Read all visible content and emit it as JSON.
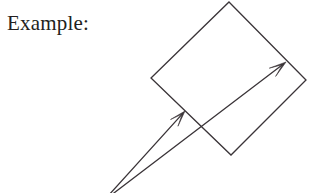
{
  "figure": {
    "caption": "Example:",
    "caption_position": {
      "x": 7,
      "y": 11
    },
    "background_color": "#ffffff",
    "stroke_color": "#3a3438",
    "text_color": "#231f20",
    "stroke_width": 1.3,
    "canvas": {
      "width": 312,
      "height": 193
    },
    "shapes": [
      {
        "name": "tilted-square",
        "type": "polygon",
        "closed": true,
        "fill": "none",
        "points": [
          {
            "x": 229,
            "y": 2
          },
          {
            "x": 306,
            "y": 80
          },
          {
            "x": 231,
            "y": 155
          },
          {
            "x": 151,
            "y": 78
          }
        ]
      }
    ],
    "vectors": [
      {
        "name": "long-arrow",
        "type": "arrow",
        "from": {
          "x": 110,
          "y": 196
        },
        "to": {
          "x": 286,
          "y": 62
        },
        "head_length": 17,
        "head_half_width": 5.2,
        "head_notch": 4.5
      },
      {
        "name": "short-arrow",
        "type": "arrow",
        "from": {
          "x": 108,
          "y": 196
        },
        "to": {
          "x": 185,
          "y": 111
        },
        "head_length": 16,
        "head_half_width": 5.0,
        "head_notch": 4.2
      }
    ]
  }
}
